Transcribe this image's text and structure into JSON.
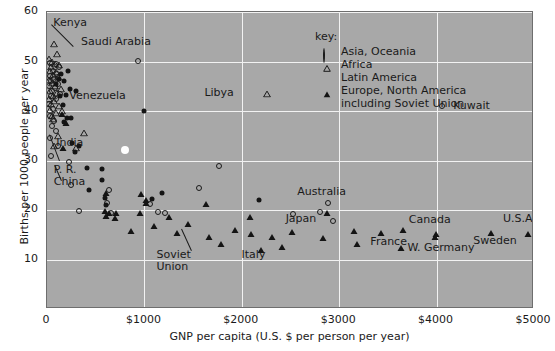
{
  "chart_data": {
    "type": "scatter",
    "title": "",
    "xlabel": "GNP per capita (U.S. $ per person per year)",
    "ylabel": "Births per 1000 people per year",
    "xlim": [
      0,
      5000
    ],
    "ylim": [
      0,
      60
    ],
    "xticks": [
      "0",
      "$1000",
      "$2000",
      "$3000",
      "$4000",
      "$5000"
    ],
    "xtick_values": [
      0,
      1000,
      2000,
      3000,
      4000,
      5000
    ],
    "yticks": [
      "10",
      "20",
      "30",
      "40",
      "50",
      "60"
    ],
    "ytick_values": [
      10,
      20,
      30,
      40,
      50,
      60
    ],
    "grid": true,
    "legend_position": "top-center-right",
    "legend_title": "key:",
    "series": [
      {
        "name": "Asia, Oceania",
        "marker": "circle-open",
        "points": [
          [
            35,
            49.8
          ],
          [
            90,
            49.5
          ],
          [
            120,
            49.0
          ],
          [
            60,
            48.0
          ],
          [
            100,
            47.5
          ],
          [
            30,
            47.0
          ],
          [
            75,
            46.5
          ],
          [
            45,
            46.0
          ],
          [
            110,
            45.5
          ],
          [
            25,
            45.0
          ],
          [
            80,
            44.6
          ],
          [
            55,
            44.0
          ],
          [
            130,
            43.5
          ],
          [
            40,
            43.0
          ],
          [
            95,
            42.5
          ],
          [
            20,
            41.5
          ],
          [
            60,
            40.5
          ],
          [
            35,
            39.0
          ],
          [
            70,
            38.0
          ],
          [
            50,
            37.0
          ],
          [
            90,
            36.0
          ],
          [
            30,
            34.5
          ],
          [
            110,
            33.0
          ],
          [
            40,
            31.0
          ],
          [
            230,
            29.8
          ],
          [
            1770,
            28.8
          ],
          [
            250,
            25.0
          ],
          [
            640,
            24.0
          ],
          [
            620,
            21.5
          ],
          [
            330,
            19.8
          ],
          [
            660,
            19.5
          ],
          [
            1060,
            21.3
          ],
          [
            1560,
            24.5
          ],
          [
            1210,
            19.5
          ],
          [
            1140,
            19.6
          ],
          [
            930,
            50.2
          ],
          [
            2880,
            21.5
          ],
          [
            2800,
            19.7
          ],
          [
            2530,
            19.3
          ],
          [
            4050,
            41.0
          ],
          [
            2940,
            17.8
          ]
        ]
      },
      {
        "name": "Africa",
        "marker": "triangle-open",
        "points": [
          [
            70,
            53.5
          ],
          [
            105,
            51.5
          ],
          [
            20,
            50.5
          ],
          [
            55,
            50.0
          ],
          [
            85,
            49.6
          ],
          [
            125,
            49.3
          ],
          [
            40,
            48.8
          ],
          [
            30,
            48.0
          ],
          [
            95,
            47.8
          ],
          [
            65,
            47.2
          ],
          [
            115,
            46.8
          ],
          [
            25,
            46.2
          ],
          [
            50,
            45.6
          ],
          [
            80,
            45.0
          ],
          [
            140,
            44.5
          ],
          [
            35,
            44.0
          ],
          [
            100,
            43.6
          ],
          [
            60,
            43.0
          ],
          [
            20,
            42.5
          ],
          [
            75,
            42.0
          ],
          [
            45,
            41.5
          ],
          [
            120,
            41.0
          ],
          [
            30,
            40.2
          ],
          [
            150,
            40.0
          ],
          [
            90,
            39.6
          ],
          [
            55,
            39.0
          ],
          [
            65,
            38.4
          ],
          [
            110,
            35.0
          ],
          [
            380,
            35.5
          ],
          [
            300,
            32.5
          ],
          [
            2260,
            43.5
          ],
          [
            70,
            33.0
          ]
        ]
      },
      {
        "name": "Latin America",
        "marker": "circle-fill",
        "points": [
          [
            145,
            47.5
          ],
          [
            215,
            48.0
          ],
          [
            120,
            46.5
          ],
          [
            175,
            46.0
          ],
          [
            90,
            45.5
          ],
          [
            240,
            44.5
          ],
          [
            300,
            44.0
          ],
          [
            190,
            43.2
          ],
          [
            135,
            43.0
          ],
          [
            160,
            41.3
          ],
          [
            205,
            38.5
          ],
          [
            175,
            37.8
          ],
          [
            1000,
            40.0
          ],
          [
            260,
            33.5
          ],
          [
            330,
            33.0
          ],
          [
            285,
            31.8
          ],
          [
            410,
            28.5
          ],
          [
            560,
            28.3
          ],
          [
            560,
            26.0
          ],
          [
            430,
            24.0
          ],
          [
            590,
            22.5
          ],
          [
            610,
            21.0
          ],
          [
            1180,
            23.5
          ],
          [
            1080,
            22.2
          ],
          [
            2180,
            22.0
          ],
          [
            250,
            38.5
          ]
        ]
      },
      {
        "name": "Europe, North America including Soviet Union",
        "marker": "triangle-fill",
        "points": [
          [
            150,
            39.5
          ],
          [
            190,
            37.5
          ],
          [
            160,
            32.5
          ],
          [
            610,
            23.5
          ],
          [
            960,
            23.3
          ],
          [
            1020,
            22.0
          ],
          [
            1015,
            21.4
          ],
          [
            590,
            19.8
          ],
          [
            640,
            19.4
          ],
          [
            710,
            19.5
          ],
          [
            950,
            19.5
          ],
          [
            1250,
            18.5
          ],
          [
            610,
            18.8
          ],
          [
            700,
            18.3
          ],
          [
            1450,
            17.2
          ],
          [
            1100,
            16.7
          ],
          [
            860,
            15.8
          ],
          [
            1330,
            15.4
          ],
          [
            1660,
            14.5
          ],
          [
            1930,
            16.0
          ],
          [
            2090,
            15.2
          ],
          [
            2310,
            14.6
          ],
          [
            2200,
            12.0
          ],
          [
            2410,
            12.6
          ],
          [
            1790,
            13.2
          ],
          [
            2080,
            18.6
          ],
          [
            2520,
            15.6
          ],
          [
            2830,
            14.3
          ],
          [
            2870,
            19.5
          ],
          [
            3150,
            15.8
          ],
          [
            3180,
            13.2
          ],
          [
            3430,
            15.4
          ],
          [
            3650,
            15.9
          ],
          [
            3630,
            12.3
          ],
          [
            3990,
            15.2
          ],
          [
            3980,
            14.6
          ],
          [
            4560,
            15.4
          ],
          [
            4940,
            15.2
          ],
          [
            1630,
            21.2
          ]
        ]
      }
    ],
    "special_points": [
      {
        "label": "1972 world average",
        "marker": "white-dot",
        "x": 800,
        "y": 32.2
      }
    ],
    "annotations": [
      {
        "text": "Kenya",
        "x": 65,
        "y": 56.5,
        "leader": true
      },
      {
        "text": "Saudi Arabia",
        "x": 350,
        "y": 53.0,
        "leader": false
      },
      {
        "text": "Libya",
        "x": 2000,
        "y": 43.6,
        "leader": false
      },
      {
        "text": "Venezuela",
        "x": 870,
        "y": 41.5,
        "leader": false
      },
      {
        "text": "India",
        "x": 95,
        "y": 33.5,
        "leader": true
      },
      {
        "text": "P. R. China",
        "x": 70,
        "y": 28.0,
        "leader": true
      },
      {
        "text": "Australia",
        "x": 2820,
        "y": 22.3,
        "leader": false
      },
      {
        "text": "Japan",
        "x": 2450,
        "y": 19.0,
        "leader": false
      },
      {
        "text": "Soviet Union",
        "x": 1300,
        "y": 11.0,
        "leader": true
      },
      {
        "text": "Italy",
        "x": 2120,
        "y": 11.0,
        "leader": false
      },
      {
        "text": "France",
        "x": 3320,
        "y": 14.0,
        "leader": false
      },
      {
        "text": "W. Germany",
        "x": 3700,
        "y": 12.3,
        "leader": false
      },
      {
        "text": "Canada",
        "x": 3930,
        "y": 16.8,
        "leader": false
      },
      {
        "text": "Sweden",
        "x": 4600,
        "y": 14.2,
        "leader": false
      },
      {
        "text": "U.S.A.",
        "x": 4850,
        "y": 17.0,
        "leader": false
      },
      {
        "text": "Kuwait",
        "x": 4170,
        "y": 41.0,
        "leader": false
      }
    ]
  },
  "legend": {
    "title": "key:",
    "entries": [
      {
        "label": "Asia, Oceania",
        "marker": "circle-open"
      },
      {
        "label": "Africa",
        "marker": "triangle-open"
      },
      {
        "label": "Latin America",
        "marker": "circle-fill"
      },
      {
        "label": "Europe, North America including Soviet Union",
        "marker": "triangle-fill",
        "line1": "Europe, North America",
        "line2": "including Soviet Union"
      }
    ]
  },
  "colors": {
    "plot_background": "#a8a8a8",
    "gridline": "#f2f2f2",
    "marker": "#141414",
    "text": "#1a1a1a",
    "page_background": "#ffffff",
    "highlight_dot": "#ffffff"
  }
}
